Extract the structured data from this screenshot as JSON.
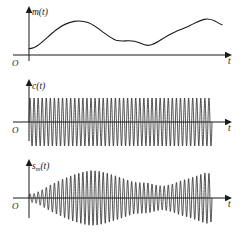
{
  "figure": {
    "ink_color": "#1a1a1a",
    "background_color": "#ffffff"
  },
  "panels": [
    {
      "id": "message",
      "y_label": "m(t)",
      "y_label_base": "m",
      "origin_label": "O",
      "x_label": "t",
      "axis_y_px": 55,
      "axis_x_px": 29
    },
    {
      "id": "carrier",
      "y_label": "c(t)",
      "y_label_base": "c",
      "origin_label": "O",
      "x_label": "t",
      "axis_y_px": 122,
      "axis_x_px": 29
    },
    {
      "id": "modulated",
      "y_label": "s_m(t)",
      "y_label_base": "s",
      "y_label_subscript": "m",
      "y_label_tail": "(t)",
      "origin_label": "O",
      "x_label": "t",
      "axis_y_px": 198,
      "axis_x_px": 29
    }
  ],
  "chart_data": {
    "type": "line",
    "xlabel": "t",
    "ylabel": "amplitude",
    "grid": false,
    "legend": "none",
    "x_range": [
      0,
      1
    ],
    "subplots": [
      {
        "name": "m(t)",
        "description": "Slowly varying baseband message signal, strictly positive, starting low, rising to a first peak, dipping to a local minimum, then rising to a second peak near the end.",
        "ylim": [
          0,
          1.05
        ],
        "x": [
          0.0,
          0.03,
          0.07,
          0.12,
          0.18,
          0.24,
          0.3,
          0.34,
          0.38,
          0.43,
          0.48,
          0.53,
          0.57,
          0.61,
          0.65,
          0.69,
          0.73,
          0.78,
          0.83,
          0.88,
          0.93,
          0.97,
          1.0
        ],
        "y": [
          0.13,
          0.14,
          0.25,
          0.42,
          0.58,
          0.72,
          0.82,
          0.86,
          0.84,
          0.77,
          0.68,
          0.58,
          0.5,
          0.48,
          0.47,
          0.41,
          0.37,
          0.43,
          0.54,
          0.62,
          0.72,
          0.8,
          0.74
        ]
      },
      {
        "name": "c(t)",
        "description": "High frequency sinusoidal carrier of constant amplitude, about 45 cycles across the axis.",
        "ylim": [
          -1.05,
          1.05
        ],
        "cycles": 45,
        "amplitude": 1.0,
        "waveform": "sine"
      },
      {
        "name": "s_m(t)",
        "description": "Amplitude modulated signal: carrier multiplied by the message envelope m(t); the positive and negative envelopes mirror the m(t) curve.",
        "ylim": [
          -1.05,
          1.05
        ],
        "cycles": 45,
        "envelope_source": "m(t)",
        "waveform": "sine"
      }
    ]
  }
}
